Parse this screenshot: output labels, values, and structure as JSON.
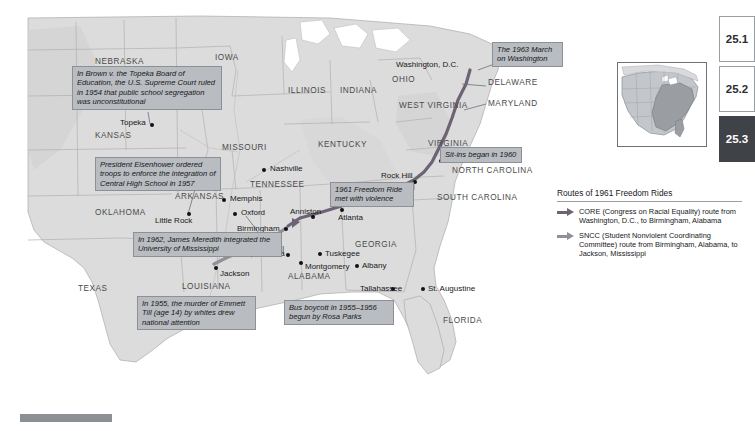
{
  "figure": {
    "bottom_bar_label": "section-progress-bar"
  },
  "map": {
    "state_labels": [
      {
        "name": "NEBRASKA",
        "x": 95,
        "y": 57
      },
      {
        "name": "IOWA",
        "x": 215,
        "y": 53
      },
      {
        "name": "ILLINOIS",
        "x": 288,
        "y": 86
      },
      {
        "name": "INDIANA",
        "x": 340,
        "y": 86
      },
      {
        "name": "OHIO",
        "x": 392,
        "y": 75
      },
      {
        "name": "KANSAS",
        "x": 95,
        "y": 131
      },
      {
        "name": "MISSOURI",
        "x": 222,
        "y": 143
      },
      {
        "name": "KENTUCKY",
        "x": 318,
        "y": 140
      },
      {
        "name": "WEST\nVIRGINIA",
        "x": 399,
        "y": 106
      },
      {
        "name": "VIRGINIA",
        "x": 428,
        "y": 139
      },
      {
        "name": "DELAWARE",
        "x": 488,
        "y": 82
      },
      {
        "name": "MARYLAND",
        "x": 488,
        "y": 101
      },
      {
        "name": "NORTH\nCAROLINA",
        "x": 452,
        "y": 170
      },
      {
        "name": "SOUTH\nCAROLINA",
        "x": 437,
        "y": 197
      },
      {
        "name": "TENNESSEE",
        "x": 250,
        "y": 180
      },
      {
        "name": "ARKANSAS",
        "x": 175,
        "y": 192
      },
      {
        "name": "OKLAHOMA",
        "x": 95,
        "y": 208
      },
      {
        "name": "MISSISSIPPI",
        "x": 230,
        "y": 245
      },
      {
        "name": "ALABAMA",
        "x": 288,
        "y": 272
      },
      {
        "name": "GEORGIA",
        "x": 355,
        "y": 240
      },
      {
        "name": "LOUISIANA",
        "x": 182,
        "y": 282
      },
      {
        "name": "TEXAS",
        "x": 78,
        "y": 284
      },
      {
        "name": "FLORIDA",
        "x": 443,
        "y": 316
      }
    ],
    "cities": [
      {
        "name": "Topeka",
        "x": 135,
        "y": 125,
        "anchor": "right"
      },
      {
        "name": "Nashville",
        "x": 270,
        "y": 169,
        "anchor": "left"
      },
      {
        "name": "Memphis",
        "x": 230,
        "y": 199,
        "anchor": "left"
      },
      {
        "name": "Oxford",
        "x": 241,
        "y": 213,
        "anchor": "left"
      },
      {
        "name": "Little Rock",
        "x": 181,
        "y": 218,
        "anchor": "right"
      },
      {
        "name": "Greenwood",
        "x": 243,
        "y": 242,
        "anchor": "left"
      },
      {
        "name": "Jackson",
        "x": 222,
        "y": 268,
        "anchor": "left"
      },
      {
        "name": "New Orleans",
        "x": 248,
        "y": 311,
        "anchor": "right"
      },
      {
        "name": "Birmingham",
        "x": 283,
        "y": 231,
        "anchor": "right"
      },
      {
        "name": "Anniston",
        "x": 311,
        "y": 216,
        "anchor": "center"
      },
      {
        "name": "Selma",
        "x": 282,
        "y": 255,
        "anchor": "right"
      },
      {
        "name": "Montgomery",
        "x": 300,
        "y": 263,
        "anchor": "left"
      },
      {
        "name": "Tuskegee",
        "x": 318,
        "y": 254,
        "anchor": "left"
      },
      {
        "name": "Albany",
        "x": 355,
        "y": 265,
        "anchor": "left"
      },
      {
        "name": "Atlanta",
        "x": 345,
        "y": 218,
        "anchor": "left"
      },
      {
        "name": "Tallahassee",
        "x": 398,
        "y": 288,
        "anchor": "left"
      },
      {
        "name": "St. Augustine",
        "x": 428,
        "y": 288,
        "anchor": "left"
      },
      {
        "name": "Rock Hill",
        "x": 409,
        "y": 174,
        "anchor": "right"
      },
      {
        "name": "Greensboro",
        "x": 446,
        "y": 160,
        "anchor": "left"
      },
      {
        "name": "Washington, D.C.",
        "x": 452,
        "y": 64,
        "anchor": "right"
      }
    ],
    "callouts": [
      {
        "id": "brown",
        "text": "In Brown v. the Topeka Board of Education, the U.S. Supreme Court ruled in 1954 that public school segregation was unconstitutional",
        "x": 72,
        "y": 66,
        "w": 150
      },
      {
        "id": "eisenhower",
        "text": "President Eisenhower ordered troops to enforce the integration of Central High School in 1957",
        "x": 95,
        "y": 157,
        "w": 126
      },
      {
        "id": "meredith",
        "text": "In 1962, James Meredith integrated the University of Mississippi",
        "x": 133,
        "y": 232,
        "w": 149
      },
      {
        "id": "till",
        "text": "In 1955, the murder of Emmett Till (age 14) by whites drew national attention",
        "x": 137,
        "y": 296,
        "w": 119
      },
      {
        "id": "bus-boycott",
        "text": "Bus boycott in 1955–1956 begun by Rosa Parks",
        "x": 284,
        "y": 300,
        "w": 110
      },
      {
        "id": "freedom-ride",
        "text": "1961 Freedom Ride met with violence",
        "x": 330,
        "y": 182,
        "w": 84
      },
      {
        "id": "sit-ins",
        "text": "Sit-ins began in 1960",
        "x": 440,
        "y": 147,
        "w": 82
      },
      {
        "id": "march",
        "text": "The 1963 March on Washington",
        "x": 492,
        "y": 42,
        "w": 71
      }
    ]
  },
  "legend": {
    "title": "Routes of 1961 Freedom Rides",
    "items": [
      {
        "icon": "arrow-right-icon",
        "color": "#6e6374",
        "text": "CORE (Congress on Racial Equality) route from Washington, D.C., to Birmingham, Alabama"
      },
      {
        "icon": "arrow-right-icon",
        "color": "#8e9196",
        "text": "SNCC (Student Nonviolent Coordinating Committee) route from Birmingham, Alabama, to Jackson, Mississippi"
      }
    ]
  },
  "inset": {
    "name": "united-states-locator-map",
    "highlight_color": "#9a9da2",
    "base_color": "#c3c6ca"
  },
  "tabs": [
    {
      "label": "25.1",
      "active": false
    },
    {
      "label": "25.2",
      "active": false
    },
    {
      "label": "25.3",
      "active": true
    }
  ],
  "colors": {
    "land": "#dcdcdc",
    "water": "#ffffff",
    "callout_bg": "#b9bcc0",
    "route_core": "#6e6374",
    "route_sncc": "#8e9196",
    "tab_active_bg": "#3f4246"
  }
}
